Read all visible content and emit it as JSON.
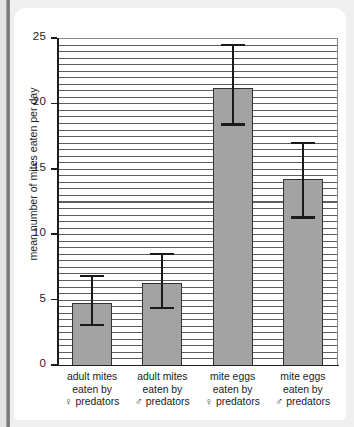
{
  "chart_data": {
    "type": "bar",
    "title": "",
    "xlabel": "",
    "ylabel": "mean number of mites eaten per day",
    "ylim": [
      0,
      25
    ],
    "yticks": [
      0,
      5,
      10,
      15,
      20,
      25
    ],
    "grid": true,
    "grid_orientation": "horizontal",
    "legend": "none",
    "error_bars": true,
    "categories": [
      "adult mites eaten by ♀ predators",
      "adult mites eaten by ♂ predators",
      "mite eggs eaten by ♀ predators",
      "mite eggs eaten by ♂ predators"
    ],
    "category_lines": [
      [
        "adult mites",
        "eaten by",
        "♀ predators"
      ],
      [
        "adult mites",
        "eaten by",
        "♂ predators"
      ],
      [
        "mite eggs",
        "eaten by",
        "♀ predators"
      ],
      [
        "mite eggs",
        "eaten by",
        "♂ predators"
      ]
    ],
    "values": [
      4.75,
      6.3,
      21.2,
      14.2
    ],
    "error_low": [
      3.0,
      4.3,
      18.3,
      11.2
    ],
    "error_high": [
      6.7,
      8.4,
      24.4,
      16.9
    ],
    "bar_color": "#a3a3a3",
    "bar_edge_color": "#333333",
    "error_color": "#1a1a1a",
    "axis_color": "#1c1c1c"
  },
  "axis": {
    "y_tick_labels": [
      "0",
      "5",
      "10",
      "15",
      "20",
      "25"
    ],
    "y_axis_title": "mean number of mites eaten per day"
  },
  "page": {
    "background_color": "#efefef",
    "card_color": "#ffffff",
    "edge_color": "#6f6f6f"
  }
}
